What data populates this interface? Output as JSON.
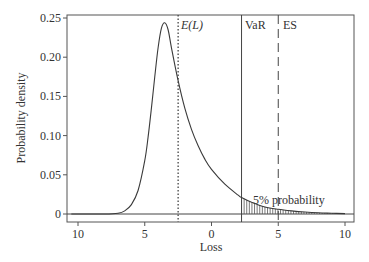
{
  "chart_data": {
    "type": "line",
    "title": "",
    "xlabel": "Loss",
    "ylabel": "Probability density",
    "x_ticks": [
      -10,
      -5,
      0,
      5,
      10
    ],
    "x_tick_labels": [
      "10",
      "5",
      "0",
      "5",
      "10"
    ],
    "y_ticks": [
      0,
      0.05,
      0.1,
      0.15,
      0.2,
      0.25
    ],
    "y_tick_labels": [
      "0",
      "0.05",
      "0.10",
      "0.15",
      "0.20",
      "0.25"
    ],
    "xlim": [
      -10.8,
      10.7
    ],
    "ylim": [
      -0.01,
      0.253
    ],
    "grid": false,
    "legend": null,
    "series": [
      {
        "name": "Loss distribution density",
        "style": "solid",
        "x": [
          -10.5,
          -8,
          -7,
          -6.5,
          -6,
          -5.5,
          -5,
          -4.75,
          -4.5,
          -4.25,
          -4,
          -3.75,
          -3.5,
          -3.25,
          -3,
          -2.5,
          -2,
          -1.5,
          -1,
          -0.5,
          0,
          1,
          2,
          2.25,
          3,
          4,
          5,
          6,
          7,
          8,
          9,
          10
        ],
        "y": [
          0,
          0,
          0.001,
          0.004,
          0.012,
          0.03,
          0.068,
          0.098,
          0.135,
          0.175,
          0.212,
          0.237,
          0.244,
          0.235,
          0.212,
          0.17,
          0.135,
          0.108,
          0.087,
          0.07,
          0.057,
          0.038,
          0.024,
          0.021,
          0.015,
          0.009,
          0.006,
          0.004,
          0.0025,
          0.0015,
          0.001,
          0.0005
        ]
      }
    ],
    "vertical_lines": [
      {
        "name": "Expected loss",
        "label": "E(L)",
        "x": -2.5,
        "style": "dotted"
      },
      {
        "name": "Value at Risk",
        "label": "VaR",
        "x": 2.25,
        "style": "solid"
      },
      {
        "name": "Expected Shortfall",
        "label": "ES",
        "x": 5.0,
        "style": "dashed"
      }
    ],
    "shaded_region": {
      "from_x": 2.25,
      "to_x": 10,
      "pattern": "vertical-hatch",
      "label": "5% probability"
    },
    "annotations": [
      {
        "text": "E(L)",
        "italic": true
      },
      {
        "text": "VaR"
      },
      {
        "text": "ES"
      },
      {
        "text": "5% probability"
      }
    ]
  },
  "layout": {
    "frame": {
      "left": 67,
      "top": 15,
      "right": 354,
      "bottom": 222
    },
    "x_px": {
      "v0": -10,
      "p0": 78,
      "v1": 10,
      "p1": 345
    },
    "y_px": {
      "v0": 0,
      "p0": 214,
      "v1": 0.25,
      "p1": 18
    },
    "colors": {
      "line": "#3a3a3a",
      "frame": "#555555",
      "text": "#333333"
    }
  }
}
